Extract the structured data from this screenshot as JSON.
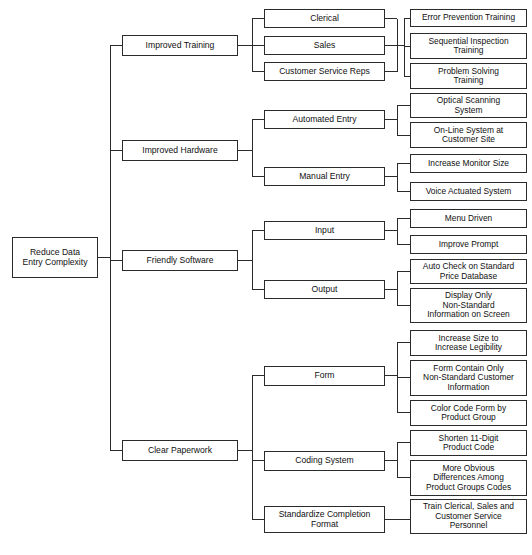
{
  "diagram": {
    "type": "tree-diagram",
    "orientation": "left-to-right",
    "levels": 4,
    "style": {
      "box_border_color": "#2b2b2b",
      "box_fill_color": "#ffffff",
      "line_color": "#2b2b2b",
      "background": "#ffffff"
    },
    "root": {
      "label": "Reduce Data\nEntry Complexity",
      "line1": "Reduce Data",
      "line2": "Entry Complexity"
    },
    "branches": [
      {
        "label": "Improved Training",
        "children": [
          {
            "label": "Clerical",
            "leaves": []
          },
          {
            "label": "Sales",
            "leaves": []
          },
          {
            "label": "Customer Service Reps",
            "leaves": []
          }
        ],
        "shared_leaves": [
          {
            "lines": [
              "Error Prevention Training"
            ]
          },
          {
            "lines": [
              "Sequential Inspection",
              "Training"
            ]
          },
          {
            "lines": [
              "Problem Solving",
              "Training"
            ]
          }
        ]
      },
      {
        "label": "Improved Hardware",
        "children": [
          {
            "label": "Automated Entry",
            "leaves": [
              {
                "lines": [
                  "Optical Scanning",
                  "System"
                ]
              },
              {
                "lines": [
                  "On-Line System at",
                  "Customer Site"
                ]
              }
            ]
          },
          {
            "label": "Manual Entry",
            "leaves": [
              {
                "lines": [
                  "Increase Monitor Size"
                ]
              },
              {
                "lines": [
                  "Voice Actuated System"
                ]
              }
            ]
          }
        ]
      },
      {
        "label": "Friendly Software",
        "children": [
          {
            "label": "Input",
            "leaves": [
              {
                "lines": [
                  "Menu Driven"
                ]
              },
              {
                "lines": [
                  "Improve Prompt"
                ]
              }
            ]
          },
          {
            "label": "Output",
            "leaves": [
              {
                "lines": [
                  "Auto Check on Standard",
                  "Price Database"
                ]
              },
              {
                "lines": [
                  "Display Only",
                  "Non-Standard",
                  "Information on Screen"
                ]
              }
            ]
          }
        ]
      },
      {
        "label": "Clear Paperwork",
        "children": [
          {
            "label": "Form",
            "leaves": [
              {
                "lines": [
                  "Increase Size to",
                  "Increase Legibility"
                ]
              },
              {
                "lines": [
                  "Form Contain Only",
                  "Non-Standard Customer",
                  "Information"
                ]
              },
              {
                "lines": [
                  "Color Code Form by",
                  "Product Group"
                ]
              }
            ]
          },
          {
            "label": "Coding System",
            "leaves": [
              {
                "lines": [
                  "Shorten 11-Digit",
                  "Product Code"
                ]
              },
              {
                "lines": [
                  "More Obvious",
                  "Differences Among",
                  "Product Groups Codes"
                ]
              }
            ]
          },
          {
            "label": "Standardize Completion Format",
            "label_lines": [
              "Standardize Completion",
              "Format"
            ],
            "leaves": [
              {
                "lines": [
                  "Train Clerical, Sales and",
                  "Customer Service",
                  "Personnel"
                ]
              }
            ]
          }
        ]
      }
    ],
    "nodes": {
      "root": {
        "x": 12,
        "y": 237,
        "w": 86,
        "h": 41,
        "lines": [
          "Reduce Data",
          "Entry Complexity"
        ]
      },
      "improved_training": {
        "x": 122,
        "y": 35,
        "w": 116,
        "h": 21,
        "lines": [
          "Improved Training"
        ]
      },
      "improved_hardware": {
        "x": 122,
        "y": 140,
        "w": 116,
        "h": 21,
        "lines": [
          "Improved Hardware"
        ]
      },
      "friendly_software": {
        "x": 122,
        "y": 250,
        "w": 116,
        "h": 21,
        "lines": [
          "Friendly Software"
        ]
      },
      "clear_paperwork": {
        "x": 122,
        "y": 440,
        "w": 116,
        "h": 21,
        "lines": [
          "Clear Paperwork"
        ]
      },
      "clerical": {
        "x": 264,
        "y": 9,
        "w": 121,
        "h": 19,
        "lines": [
          "Clerical"
        ]
      },
      "sales": {
        "x": 264,
        "y": 36,
        "w": 121,
        "h": 19,
        "lines": [
          "Sales"
        ]
      },
      "customer_service_reps": {
        "x": 264,
        "y": 62,
        "w": 121,
        "h": 19,
        "lines": [
          "Customer Service Reps"
        ]
      },
      "automated_entry": {
        "x": 264,
        "y": 110,
        "w": 121,
        "h": 19,
        "lines": [
          "Automated Entry"
        ]
      },
      "manual_entry": {
        "x": 264,
        "y": 167,
        "w": 121,
        "h": 19,
        "lines": [
          "Manual Entry"
        ]
      },
      "input": {
        "x": 264,
        "y": 221,
        "w": 121,
        "h": 19,
        "lines": [
          "Input"
        ]
      },
      "output": {
        "x": 264,
        "y": 280,
        "w": 121,
        "h": 19,
        "lines": [
          "Output"
        ]
      },
      "form": {
        "x": 264,
        "y": 366,
        "w": 121,
        "h": 20,
        "lines": [
          "Form"
        ]
      },
      "coding_system": {
        "x": 264,
        "y": 451,
        "w": 121,
        "h": 20,
        "lines": [
          "Coding System"
        ]
      },
      "standardize_format": {
        "x": 264,
        "y": 506,
        "w": 121,
        "h": 27,
        "lines": [
          "Standardize Completion",
          "Format"
        ]
      },
      "error_prevention": {
        "x": 410,
        "y": 9,
        "w": 117,
        "h": 18,
        "lines": [
          "Error Prevention Training"
        ]
      },
      "sequential_inspection": {
        "x": 410,
        "y": 33,
        "w": 117,
        "h": 26,
        "lines": [
          "Sequential Inspection",
          "Training"
        ]
      },
      "problem_solving": {
        "x": 410,
        "y": 63,
        "w": 117,
        "h": 26,
        "lines": [
          "Problem Solving",
          "Training"
        ]
      },
      "optical_scanning": {
        "x": 410,
        "y": 93,
        "w": 117,
        "h": 25,
        "lines": [
          "Optical Scanning",
          "System"
        ]
      },
      "online_system": {
        "x": 410,
        "y": 122,
        "w": 117,
        "h": 26,
        "lines": [
          "On-Line System at",
          "Customer Site"
        ]
      },
      "increase_monitor": {
        "x": 410,
        "y": 154,
        "w": 117,
        "h": 19,
        "lines": [
          "Increase Monitor Size"
        ]
      },
      "voice_actuated": {
        "x": 410,
        "y": 182,
        "w": 117,
        "h": 19,
        "lines": [
          "Voice Actuated System"
        ]
      },
      "menu_driven": {
        "x": 410,
        "y": 209,
        "w": 117,
        "h": 19,
        "lines": [
          "Menu Driven"
        ]
      },
      "improve_prompt": {
        "x": 410,
        "y": 235,
        "w": 117,
        "h": 19,
        "lines": [
          "Improve Prompt"
        ]
      },
      "auto_check": {
        "x": 410,
        "y": 259,
        "w": 117,
        "h": 25,
        "lines": [
          "Auto Check on Standard",
          "Price Database"
        ]
      },
      "display_only": {
        "x": 410,
        "y": 288,
        "w": 117,
        "h": 35,
        "lines": [
          "Display Only",
          "Non-Standard",
          "Information on Screen"
        ]
      },
      "increase_size": {
        "x": 410,
        "y": 330,
        "w": 117,
        "h": 26,
        "lines": [
          "Increase Size to",
          "Increase Legibility"
        ]
      },
      "form_contain_only": {
        "x": 410,
        "y": 360,
        "w": 117,
        "h": 36,
        "lines": [
          "Form Contain Only",
          "Non-Standard Customer",
          "Information"
        ]
      },
      "color_code_form": {
        "x": 410,
        "y": 400,
        "w": 117,
        "h": 26,
        "lines": [
          "Color Code Form by",
          "Product Group"
        ]
      },
      "shorten_product_code": {
        "x": 410,
        "y": 430,
        "w": 117,
        "h": 26,
        "lines": [
          "Shorten 11-Digit",
          "Product Code"
        ]
      },
      "more_obvious": {
        "x": 410,
        "y": 460,
        "w": 117,
        "h": 36,
        "lines": [
          "More Obvious",
          "Differences Among",
          "Product Groups Codes"
        ]
      },
      "train_personnel": {
        "x": 410,
        "y": 499,
        "w": 117,
        "h": 35,
        "lines": [
          "Train Clerical, Sales and",
          "Customer Service",
          "Personnel"
        ]
      }
    }
  }
}
